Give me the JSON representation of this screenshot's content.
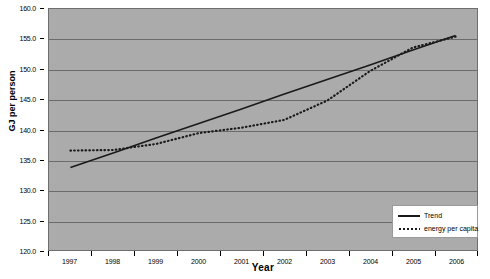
{
  "chart_data": {
    "type": "line",
    "title": "",
    "xlabel": "Year",
    "ylabel": "GJ per person",
    "x": [
      1997,
      1998,
      1999,
      2000,
      2001,
      2002,
      2003,
      2004,
      2005,
      2006
    ],
    "categories": [
      "1997",
      "1998",
      "1999",
      "2000",
      "2001",
      "2002",
      "2003",
      "2004",
      "2005",
      "2006"
    ],
    "xlim": [
      1997,
      2006
    ],
    "ylim": [
      120.0,
      160.0
    ],
    "yticks": [
      120.0,
      125.0,
      130.0,
      135.0,
      140.0,
      145.0,
      150.0,
      155.0,
      160.0
    ],
    "ytick_labels": [
      "120.0",
      "125.0",
      "130.0",
      "135.0",
      "140.0",
      "145.0",
      "150.0",
      "155.0",
      "160.0"
    ],
    "grid": true,
    "legend_position": "bottom-right",
    "series": [
      {
        "name": "Trend",
        "style": "solid",
        "color": "#1a1a1a",
        "values": [
          133.7,
          136.1,
          138.6,
          141.0,
          143.4,
          145.9,
          148.3,
          150.7,
          153.2,
          155.6
        ]
      },
      {
        "name": "energy per capita",
        "style": "dotted",
        "color": "#1a1a1a",
        "values": [
          136.5,
          136.6,
          137.6,
          139.4,
          140.3,
          141.6,
          144.8,
          149.7,
          153.6,
          155.4
        ]
      }
    ]
  },
  "legend": {
    "items": [
      {
        "label": "Trend",
        "style": "solid"
      },
      {
        "label": "energy per capita",
        "style": "dotted"
      }
    ]
  },
  "colors": {
    "plot_background": "#ababab",
    "gridline": "#6b6b6b",
    "series_line": "#1a1a1a",
    "page_background": "#ffffff"
  }
}
